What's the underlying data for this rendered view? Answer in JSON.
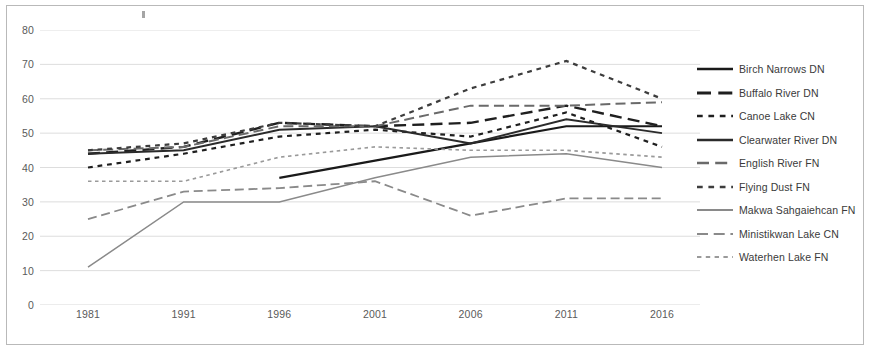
{
  "chart_data": {
    "type": "line",
    "title": "",
    "xlabel": "",
    "ylabel": "",
    "x": [
      "1981",
      "1991",
      "1996",
      "2001",
      "2006",
      "2011",
      "2016"
    ],
    "xlim": [
      0,
      6
    ],
    "ylim": [
      0,
      80
    ],
    "y_ticks": [
      0,
      10,
      20,
      30,
      40,
      50,
      60,
      70,
      80
    ],
    "grid": true,
    "legend_position": "right",
    "series": [
      {
        "name": "Birch Narrows DN",
        "style": "solid",
        "color": "#1a1a1a",
        "width": 2.2,
        "x": [
          "1996",
          "2001",
          "2006",
          "2011",
          "2016"
        ],
        "values": [
          37,
          42,
          47,
          52,
          52
        ]
      },
      {
        "name": "Buffalo River DN",
        "style": "long-dash",
        "color": "#1f1f1f",
        "width": 2.4,
        "x": [
          "1981",
          "1991",
          "1996",
          "2001",
          "2006",
          "2011",
          "2016"
        ],
        "values": [
          44,
          46,
          53,
          52,
          53,
          58,
          52
        ]
      },
      {
        "name": "Canoe Lake CN",
        "style": "short-dash",
        "color": "#1f1f1f",
        "width": 2.2,
        "x": [
          "1981",
          "1991",
          "1996",
          "2001",
          "2006",
          "2011",
          "2016"
        ],
        "values": [
          40,
          44,
          49,
          51,
          49,
          56,
          46
        ]
      },
      {
        "name": "Clearwater River DN",
        "style": "solid",
        "color": "#2b2b2b",
        "width": 2.0,
        "x": [
          "1981",
          "1991",
          "1996",
          "2001",
          "2006",
          "2011",
          "2016"
        ],
        "values": [
          44,
          45,
          51,
          52,
          47,
          54,
          50
        ]
      },
      {
        "name": "English River FN",
        "style": "long-dash",
        "color": "#6a6a6a",
        "width": 2.0,
        "x": [
          "1981",
          "1991",
          "1996",
          "2001",
          "2006",
          "2011",
          "2016"
        ],
        "values": [
          45,
          46,
          52,
          52,
          58,
          58,
          59
        ]
      },
      {
        "name": "Flying Dust FN",
        "style": "short-dash",
        "color": "#3d3d3d",
        "width": 2.2,
        "x": [
          "1981",
          "1991",
          "1996",
          "2001",
          "2006",
          "2011",
          "2016"
        ],
        "values": [
          45,
          47,
          53,
          52,
          63,
          71,
          60
        ]
      },
      {
        "name": "Makwa Sahgaiehcan FN",
        "style": "solid",
        "color": "#8a8a8a",
        "width": 1.5,
        "x": [
          "1981",
          "1991",
          "1996",
          "2001",
          "2006",
          "2011",
          "2016"
        ],
        "values": [
          11,
          30,
          30,
          37,
          43,
          44,
          40
        ]
      },
      {
        "name": "Ministikwan Lake CN",
        "style": "long-dash",
        "color": "#8a8a8a",
        "width": 1.8,
        "x": [
          "1981",
          "1991",
          "1996",
          "2001",
          "2006",
          "2011",
          "2016"
        ],
        "values": [
          25,
          33,
          34,
          36,
          26,
          31,
          31
        ]
      },
      {
        "name": "Waterhen Lake FN",
        "style": "short-dash",
        "color": "#9a9a9a",
        "width": 1.6,
        "x": [
          "1981",
          "1991",
          "1996",
          "2001",
          "2006",
          "2011",
          "2016"
        ],
        "values": [
          36,
          36,
          43,
          46,
          45,
          45,
          43
        ]
      }
    ]
  },
  "axis": {
    "y_tick_labels": [
      "80",
      "70",
      "60",
      "50",
      "40",
      "30",
      "20",
      "10",
      "0"
    ],
    "x_tick_labels": [
      "1981",
      "1991",
      "1996",
      "2001",
      "2006",
      "2011",
      "2016"
    ]
  },
  "legend": {
    "items": [
      {
        "label": "Birch Narrows DN"
      },
      {
        "label": "Buffalo River DN"
      },
      {
        "label": "Canoe Lake CN"
      },
      {
        "label": "Clearwater River DN"
      },
      {
        "label": "English River FN"
      },
      {
        "label": "Flying Dust FN"
      },
      {
        "label": "Makwa Sahgaiehcan FN"
      },
      {
        "label": "Ministikwan Lake CN"
      },
      {
        "label": "Waterhen Lake FN"
      }
    ]
  },
  "colors": {
    "grid": "#d9d9d9",
    "frame": "#b9b9b9",
    "tick_text": "#5a5a5a",
    "legend_text": "#3a3a3a"
  }
}
